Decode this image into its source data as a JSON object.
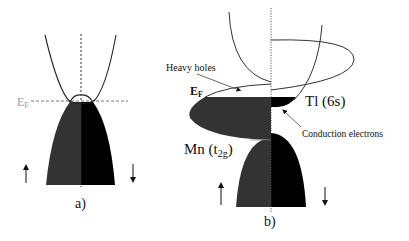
{
  "figure": {
    "type": "band-structure schematic",
    "colors": {
      "spin_up_fill": "#333333",
      "spin_down_fill": "#000000",
      "line": "#333333",
      "fermi_label_panel_a": "#9a9a9a",
      "background": "#ffffff"
    }
  },
  "panel_a": {
    "label": "a)",
    "fermi_label": "E",
    "fermi_sub": "F",
    "spin_up_arrow": "up-arrow",
    "spin_down_arrow": "down-arrow"
  },
  "panel_b": {
    "label": "b)",
    "fermi_label": "E",
    "fermi_sub": "F",
    "heavy_holes_label": "Heavy holes",
    "tl_label": "Tl (6s)",
    "mn_label_main": "Mn (t",
    "mn_label_sub": "2g",
    "mn_label_close": ")",
    "conduction_label": "Conduction electrons",
    "spin_up_arrow": "up-arrow",
    "spin_down_arrow": "down-arrow"
  }
}
